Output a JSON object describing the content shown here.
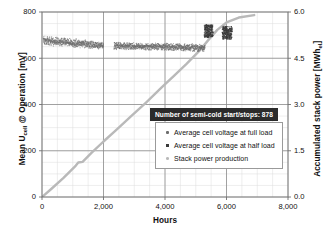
{
  "chart_data": {
    "type": "scatter",
    "title": "",
    "xlabel": "Hours",
    "ylabel": "Mean U_cell @ Operation [mV]",
    "ylabel_right": "Accumulated stack power [MWh_el]",
    "xlim": [
      0,
      8000
    ],
    "ylim": [
      0,
      800
    ],
    "ylim_right": [
      0.0,
      6.0
    ],
    "grid": true,
    "legend_position": "center-right-inside",
    "x_ticks": [
      0,
      2000,
      4000,
      6000,
      8000
    ],
    "x_tick_labels": [
      "0",
      "2,000",
      "4,000",
      "6,000",
      "8,000"
    ],
    "y_ticks": [
      0,
      200,
      400,
      600,
      800
    ],
    "y_tick_labels": [
      "0",
      "200",
      "400",
      "600",
      "800"
    ],
    "y_right_ticks": [
      0.0,
      1.5,
      3.0,
      4.5,
      6.0
    ],
    "y_right_tick_labels": [
      "0.0",
      "1.5",
      "3.0",
      "4.5",
      "6.0"
    ],
    "annotations": [
      {
        "text": "Number of semi-cold start/stops: 878",
        "x": 4200,
        "y": 330,
        "style": "dark-box-white-text"
      }
    ],
    "series": [
      {
        "name": "Average cell voltage at full load",
        "type": "scatter",
        "axis": "left",
        "color": "#6d6d6d",
        "marker": "dot",
        "segments": [
          {
            "x_start": 40,
            "x_end": 2000,
            "y_upper_start": 700,
            "y_upper_end": 672,
            "y_lower_start": 655,
            "y_lower_end": 638
          },
          {
            "x_start": 2340,
            "x_end": 5300,
            "y_upper_start": 672,
            "y_upper_end": 662,
            "y_lower_start": 636,
            "y_lower_end": 628
          }
        ]
      },
      {
        "name": "Average cell voltage at half load",
        "type": "scatter",
        "axis": "left",
        "color": "#3a3a3a",
        "marker": "square",
        "clusters": [
          {
            "x_start": 5280,
            "x_end": 5560,
            "y_low": 690,
            "y_high": 745
          },
          {
            "x_start": 5860,
            "x_end": 6180,
            "y_low": 682,
            "y_high": 738
          }
        ]
      },
      {
        "name": "Stack power production",
        "type": "line",
        "axis": "right",
        "color": "#b9b9b9",
        "points": [
          {
            "x": 0,
            "y": 0.0
          },
          {
            "x": 300,
            "y": 0.26
          },
          {
            "x": 700,
            "y": 0.62
          },
          {
            "x": 1100,
            "y": 1.02
          },
          {
            "x": 1180,
            "y": 1.12
          },
          {
            "x": 1320,
            "y": 1.14
          },
          {
            "x": 1600,
            "y": 1.42
          },
          {
            "x": 2000,
            "y": 1.8
          },
          {
            "x": 2400,
            "y": 2.16
          },
          {
            "x": 2900,
            "y": 2.62
          },
          {
            "x": 3400,
            "y": 3.08
          },
          {
            "x": 3900,
            "y": 3.56
          },
          {
            "x": 4300,
            "y": 3.94
          },
          {
            "x": 4700,
            "y": 4.32
          },
          {
            "x": 5100,
            "y": 4.72
          },
          {
            "x": 5400,
            "y": 5.08
          },
          {
            "x": 5700,
            "y": 5.42
          },
          {
            "x": 6000,
            "y": 5.66
          },
          {
            "x": 6400,
            "y": 5.82
          },
          {
            "x": 6900,
            "y": 5.9
          }
        ]
      }
    ]
  },
  "axes": {
    "x_title": "Hours",
    "y_left_title_main": "Mean U",
    "y_left_title_sub": "cell",
    "y_left_title_rest": " @ Operation [mV]",
    "y_right_title_main": "Accumulated stack power [MWh",
    "y_right_title_sub": "el",
    "y_right_title_rest": "]"
  },
  "annotation": {
    "text": "Number of semi-cold start/stops: 878"
  },
  "legend": {
    "items": [
      {
        "label": "Average cell voltage at full load",
        "marker": "dot",
        "color": "#6d6d6d"
      },
      {
        "label": "Average cell voltage at half load",
        "marker": "square",
        "color": "#3a3a3a"
      },
      {
        "label": "Stack power production",
        "marker": "line",
        "color": "#b9b9b9"
      }
    ]
  },
  "colors": {
    "full_load": "#6d6d6d",
    "half_load": "#3a3a3a",
    "power_line": "#b9b9b9",
    "grid_major": "#8d8d8d",
    "grid_minor": "#dcdcdc",
    "frame": "#6f6f6f",
    "annotation_bg": "#2b2b2b",
    "annotation_fg": "#ffffff"
  }
}
